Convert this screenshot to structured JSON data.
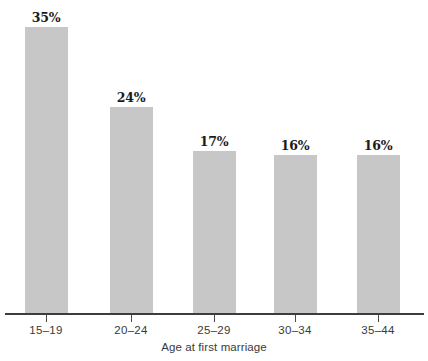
{
  "chart_data": {
    "type": "bar",
    "title": "",
    "subtitle": "",
    "xlabel": "Age at first marriage",
    "ylabel": "",
    "categories": [
      "15–19",
      "20–24",
      "25–29",
      "30–34",
      "35–44"
    ],
    "values": [
      35,
      24,
      17,
      16,
      16
    ],
    "value_labels": [
      "35%",
      "24%",
      "17%",
      "16%",
      "16%"
    ],
    "ylim": [
      0,
      40
    ],
    "grid": false,
    "legend": null,
    "legend_position": "none",
    "series": [
      {
        "name": "Percent",
        "values": [
          35,
          24,
          17,
          16,
          16
        ]
      }
    ],
    "annotations": [],
    "colors": {
      "bar_fill": "#c7c7c7",
      "axis": "#3d3d3d",
      "tick_label": "#3a3a3a",
      "value_label": "#1b1b1b",
      "background": "#ffffff"
    }
  },
  "bars": [
    {
      "label": "15–19",
      "value_label": "35%",
      "left": 25,
      "width": 43,
      "top": 27,
      "height": 286,
      "center": 46
    },
    {
      "label": "20–24",
      "value_label": "24%",
      "left": 110,
      "width": 43,
      "top": 107,
      "height": 206,
      "center": 131
    },
    {
      "label": "25–29",
      "value_label": "17%",
      "left": 193,
      "width": 43,
      "top": 151,
      "height": 162,
      "center": 214
    },
    {
      "label": "30–34",
      "value_label": "16%",
      "left": 274,
      "width": 43,
      "top": 155,
      "height": 158,
      "center": 295
    },
    {
      "label": "35–44",
      "value_label": "16%",
      "left": 357,
      "width": 43,
      "top": 155,
      "height": 158,
      "center": 378
    }
  ],
  "bleed_text": {
    "note": "faint show-through from the reverse side of the scanned page; illegible",
    "lines": [
      {
        "text": " ",
        "top": 12,
        "left": 120,
        "kind": "body"
      },
      {
        "text": " ",
        "top": 30,
        "left": 150,
        "kind": "body"
      },
      {
        "text": " ",
        "top": 48,
        "left": 130,
        "kind": "body"
      },
      {
        "text": " ",
        "top": 66,
        "left": 160,
        "kind": "body"
      },
      {
        "text": " ",
        "top": 120,
        "left": 200,
        "kind": "body"
      },
      {
        "text": " ",
        "top": 138,
        "left": 180,
        "kind": "body"
      },
      {
        "text": " ",
        "top": 332,
        "left": 230,
        "kind": "head"
      }
    ]
  }
}
